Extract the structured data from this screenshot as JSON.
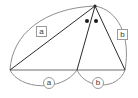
{
  "figure": {
    "type": "geometry-diagram",
    "background_color": "#ffffff",
    "stroke_color_dark": "#2b2b2b",
    "stroke_color_light": "#8f8f8f",
    "label_border_color": "#9a9a9a",
    "label_text_color": "#3a3a3a"
  },
  "labels": {
    "side_a": "a",
    "side_b": "b",
    "base_a": "a",
    "base_b": "b"
  },
  "points": {
    "apex": {
      "x": 95,
      "y": 6,
      "name": "apex"
    },
    "left_vertex": {
      "x": 10,
      "y": 70,
      "name": "left-vertex"
    },
    "middle_vertex": {
      "x": 77,
      "y": 70,
      "name": "middle-vertex"
    },
    "right_vertex": {
      "x": 125,
      "y": 70,
      "name": "right-vertex"
    }
  },
  "angle_marks": [
    {
      "x": 87,
      "y": 21,
      "name": "angle-dot-left"
    },
    {
      "x": 96,
      "y": 21,
      "name": "angle-dot-right"
    }
  ],
  "segments": [
    {
      "name": "base-line",
      "from": "left_vertex",
      "to": "right_vertex",
      "style": "dark"
    },
    {
      "name": "left-slant",
      "from": "left_vertex",
      "to": "apex",
      "style": "dark"
    },
    {
      "name": "middle-slant",
      "from": "middle_vertex",
      "to": "apex",
      "style": "dark"
    },
    {
      "name": "right-slant",
      "from": "right_vertex",
      "to": "apex",
      "style": "dark"
    }
  ],
  "arcs": [
    {
      "name": "arc-side-a",
      "style": "light",
      "label": "a"
    },
    {
      "name": "arc-side-b",
      "style": "light",
      "label": "b"
    },
    {
      "name": "arc-base-a",
      "style": "light",
      "label": "a"
    },
    {
      "name": "arc-base-b",
      "style": "light",
      "label": "b"
    }
  ]
}
